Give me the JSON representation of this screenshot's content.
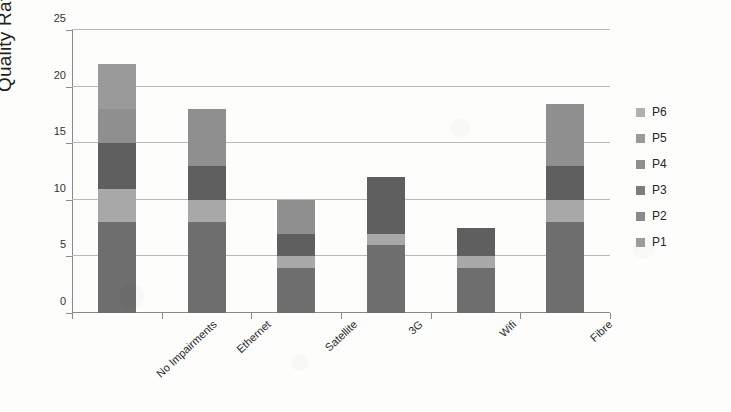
{
  "chart_data": {
    "type": "bar",
    "subtype": "stacked-vertical",
    "title": "",
    "xlabel": "",
    "ylabel": "Quality Ratings",
    "ylim": [
      0,
      25
    ],
    "yticks": [
      0,
      5,
      10,
      15,
      20,
      25
    ],
    "grid": true,
    "legend_position": "right",
    "categories": [
      "No Impairments",
      "Ethernet",
      "Satellite",
      "3G",
      "Wifi",
      "Fibre"
    ],
    "series": [
      {
        "name": "P1",
        "color": "#6e6e6e",
        "values": [
          8,
          8,
          4,
          6,
          4,
          8
        ]
      },
      {
        "name": "P2",
        "color": "#a8a8a8",
        "values": [
          3,
          2,
          1,
          1,
          1,
          2
        ]
      },
      {
        "name": "P3",
        "color": "#5f5f5f",
        "values": [
          4,
          3,
          2,
          5,
          2.5,
          3
        ]
      },
      {
        "name": "P4",
        "color": "#8f8f8f",
        "values": [
          3,
          5,
          3,
          0,
          0,
          5.5
        ]
      },
      {
        "name": "P5",
        "color": "#9a9a9a",
        "values": [
          4,
          0,
          0,
          0,
          0,
          0
        ]
      },
      {
        "name": "P6",
        "color": "#b0b0b0",
        "values": [
          0,
          0,
          0,
          0,
          0,
          0
        ]
      }
    ],
    "totals": [
      22,
      18,
      10,
      12,
      7.5,
      18.5
    ]
  },
  "legend": {
    "entries": [
      {
        "label": "P6",
        "color": "#b0b0b0"
      },
      {
        "label": "P5",
        "color": "#9a9a9a"
      },
      {
        "label": "P4",
        "color": "#8f8f8f"
      },
      {
        "label": "P3",
        "color": "#7d7d7d"
      },
      {
        "label": "P2",
        "color": "#8a8a8a"
      },
      {
        "label": "P1",
        "color": "#9e9e9e"
      }
    ]
  },
  "axes": {
    "y_title": "Quality Ratings",
    "y_tick_labels": [
      "0",
      "5",
      "10",
      "15",
      "20",
      "25"
    ],
    "x_tick_labels": [
      "No Impairments",
      "Ethernet",
      "Satellite",
      "3G",
      "Wifi",
      "Fibre"
    ]
  },
  "style": {
    "background": "#fdfdfc",
    "gridline_color": "#b9b9b9",
    "axis_color": "#8a8a8a",
    "text_color": "#2b2b2b"
  }
}
